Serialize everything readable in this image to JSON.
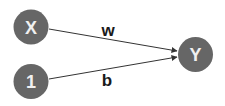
{
  "diagram": {
    "type": "graph",
    "nodes": [
      {
        "id": "x",
        "label": "X",
        "cx": 31,
        "cy": 27,
        "r": 17
      },
      {
        "id": "one",
        "label": "1",
        "cx": 31,
        "cy": 81,
        "r": 17
      },
      {
        "id": "y",
        "label": "Y",
        "cx": 195,
        "cy": 54,
        "r": 17
      }
    ],
    "edges": [
      {
        "from": "x",
        "to": "y",
        "label": "w",
        "x1": 49,
        "y1": 29,
        "x2": 177,
        "y2": 51,
        "label_x": 108,
        "label_y": 30
      },
      {
        "from": "one",
        "to": "y",
        "label": "b",
        "x1": 49,
        "y1": 79,
        "x2": 177,
        "y2": 57,
        "label_x": 107,
        "label_y": 80
      }
    ],
    "colors": {
      "node_fill": "#666666",
      "node_text": "#f0f0f0",
      "edge": "#333333",
      "edge_label": "#1a1a1a",
      "background": "#ffffff"
    }
  }
}
